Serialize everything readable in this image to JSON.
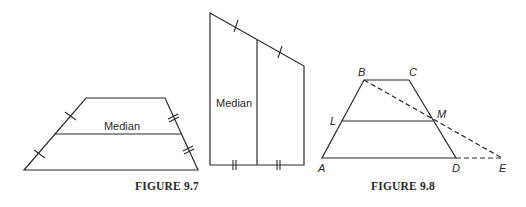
{
  "figures": {
    "fig97": {
      "caption": "FIGURE 9.7",
      "trapezoid": {
        "median_label": "Median",
        "vertices": {
          "bottom_left": [
            24,
            170
          ],
          "bottom_right": [
            198,
            170
          ],
          "top_right": [
            165,
            98
          ],
          "top_left": [
            86,
            98
          ]
        },
        "median": [
          [
            55,
            134
          ],
          [
            181,
            134
          ]
        ]
      },
      "quadrilateral": {
        "median_label": "Median",
        "vertices": {
          "top_left": [
            210,
            13
          ],
          "bottom_left": [
            210,
            165
          ],
          "bottom_right": [
            304,
            165
          ],
          "top_right": [
            304,
            66
          ]
        },
        "median": [
          [
            257,
            40
          ],
          [
            257,
            165
          ]
        ]
      }
    },
    "fig98": {
      "caption": "FIGURE 9.8",
      "points": {
        "A": {
          "label": "A",
          "xy": [
            322,
            158
          ]
        },
        "B": {
          "label": "B",
          "xy": [
            364,
            80
          ]
        },
        "C": {
          "label": "C",
          "xy": [
            409,
            80
          ]
        },
        "D": {
          "label": "D",
          "xy": [
            456,
            158
          ]
        },
        "E": {
          "label": "E",
          "xy": [
            502,
            158
          ]
        },
        "L": {
          "label": "L",
          "xy": [
            342,
            121
          ]
        },
        "M": {
          "label": "M",
          "xy": [
            433,
            121
          ]
        }
      }
    }
  },
  "colors": {
    "ink": "#2a2a2a",
    "background": "#ffffff"
  }
}
